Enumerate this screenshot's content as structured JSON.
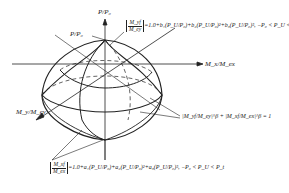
{
  "axes": {
    "vertical": "P/P₀",
    "horizontal": "M_x/M_ex",
    "oblique": "M_y/M_ey"
  },
  "labels": {
    "apex": "P/P₀"
  },
  "equations": {
    "top": {
      "lhs_num": "M_yf",
      "lhs_den": "M_ey",
      "rhs": "=1.0+b₁(P_U/P₀)+b₂(P_U/P₀)²+b₃(P_U/P₀)³, −P₀ < P_U < P_t"
    },
    "middle": {
      "text": "|M_yf/M_ey|^β + |M_xf/M_ex|^β = 1"
    },
    "bottom": {
      "lhs_num": "M_xf",
      "lhs_den": "M_ex",
      "rhs": "=1.0+a₁(P_U/P₀)+a₂(P_U/P₀)²+a₃(P_U/P₀)³, −P₀ < P_U < P_t"
    }
  },
  "colors": {
    "stroke": "#222222",
    "background": "#ffffff"
  }
}
